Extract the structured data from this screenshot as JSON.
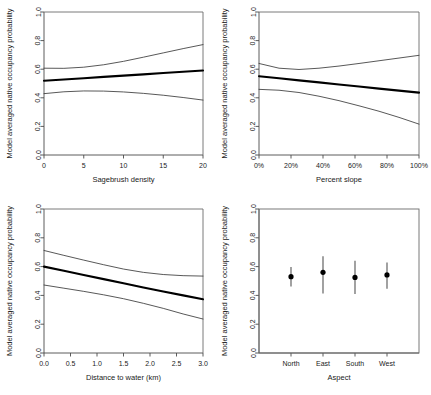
{
  "figure": {
    "background": "#ffffff",
    "axis_color": "#4a4a4a",
    "mean_color": "#000000",
    "ci_color": "#3a3a3a"
  },
  "shared": {
    "ylabel": "Model averaged native occupancy probability",
    "ylim": [
      0,
      1
    ],
    "yticks": [
      0.0,
      0.2,
      0.4,
      0.6,
      0.8,
      1.0
    ],
    "yticklabels": [
      "0.0",
      "0.2",
      "0.4",
      "0.6",
      "0.8",
      "1.0"
    ]
  },
  "chart_data": [
    {
      "type": "line",
      "panel": "top-left",
      "title": "",
      "xlabel": "Sagebrush density",
      "ylabel": "Model averaged native occupancy probability",
      "xlim": [
        0,
        20
      ],
      "ylim": [
        0,
        1
      ],
      "xticks": [
        0,
        5,
        10,
        15,
        20
      ],
      "xticklabels": [
        "0",
        "5",
        "10",
        "15",
        "20"
      ],
      "yticks": [
        0.0,
        0.2,
        0.4,
        0.6,
        0.8,
        1.0
      ],
      "yticklabels": [
        "0.0",
        "0.2",
        "0.4",
        "0.6",
        "0.8",
        "1.0"
      ],
      "grid": false,
      "legend": "none",
      "x": [
        0,
        2.5,
        5,
        7.5,
        10,
        12.5,
        15,
        17.5,
        20
      ],
      "series": [
        {
          "name": "Upper 95% CI",
          "style": "thin",
          "values": [
            0.607,
            0.606,
            0.614,
            0.631,
            0.655,
            0.684,
            0.714,
            0.744,
            0.772
          ]
        },
        {
          "name": "Model averaged estimate",
          "style": "thick",
          "values": [
            0.519,
            0.528,
            0.537,
            0.546,
            0.555,
            0.564,
            0.573,
            0.582,
            0.591
          ]
        },
        {
          "name": "Lower 95% CI",
          "style": "thin",
          "values": [
            0.429,
            0.442,
            0.448,
            0.447,
            0.441,
            0.431,
            0.418,
            0.402,
            0.384
          ]
        }
      ]
    },
    {
      "type": "line",
      "panel": "top-right",
      "title": "",
      "xlabel": "Percent slope",
      "ylabel": "Model averaged native occupancy probability",
      "xlim": [
        0,
        100
      ],
      "ylim": [
        0,
        1
      ],
      "xticks": [
        0,
        20,
        40,
        60,
        80,
        100
      ],
      "xticklabels": [
        "0%",
        "20%",
        "40%",
        "60%",
        "80%",
        "100%"
      ],
      "yticks": [
        0.0,
        0.2,
        0.4,
        0.6,
        0.8,
        1.0
      ],
      "yticklabels": [
        "0.0",
        "0.2",
        "0.4",
        "0.6",
        "0.8",
        "1.0"
      ],
      "grid": false,
      "legend": "none",
      "x": [
        0,
        12.5,
        25,
        37.5,
        50,
        62.5,
        75,
        87.5,
        100
      ],
      "series": [
        {
          "name": "Upper 95% CI",
          "style": "thin",
          "values": [
            0.64,
            0.607,
            0.598,
            0.607,
            0.622,
            0.64,
            0.659,
            0.678,
            0.697
          ]
        },
        {
          "name": "Model averaged estimate",
          "style": "thick",
          "values": [
            0.551,
            0.537,
            0.522,
            0.508,
            0.493,
            0.479,
            0.464,
            0.45,
            0.436
          ]
        },
        {
          "name": "Lower 95% CI",
          "style": "thin",
          "values": [
            0.459,
            0.453,
            0.437,
            0.411,
            0.38,
            0.344,
            0.306,
            0.263,
            0.216
          ]
        }
      ]
    },
    {
      "type": "line",
      "panel": "bottom-left",
      "title": "",
      "xlabel": "Distance to water (km)",
      "ylabel": "Model averaged native occupancy probability",
      "xlim": [
        0,
        3
      ],
      "ylim": [
        0,
        1
      ],
      "xticks": [
        0.0,
        0.5,
        1.0,
        1.5,
        2.0,
        2.5,
        3.0
      ],
      "xticklabels": [
        "0.0",
        "0.5",
        "1.0",
        "1.5",
        "2.0",
        "2.5",
        "3.0"
      ],
      "yticks": [
        0.0,
        0.2,
        0.4,
        0.6,
        0.8,
        1.0
      ],
      "yticklabels": [
        "0.0",
        "0.2",
        "0.4",
        "0.6",
        "0.8",
        "1.0"
      ],
      "grid": false,
      "legend": "none",
      "x": [
        0.0,
        0.375,
        0.75,
        1.125,
        1.5,
        1.875,
        2.25,
        2.625,
        3.0
      ],
      "series": [
        {
          "name": "Upper 95% CI",
          "style": "thin",
          "values": [
            0.712,
            0.678,
            0.645,
            0.613,
            0.583,
            0.56,
            0.545,
            0.537,
            0.534
          ]
        },
        {
          "name": "Model averaged estimate",
          "style": "thick",
          "values": [
            0.6,
            0.571,
            0.542,
            0.513,
            0.484,
            0.455,
            0.427,
            0.4,
            0.373
          ]
        },
        {
          "name": "Lower 95% CI",
          "style": "thin",
          "values": [
            0.472,
            0.45,
            0.428,
            0.404,
            0.377,
            0.345,
            0.31,
            0.271,
            0.236
          ]
        }
      ]
    },
    {
      "type": "scatter",
      "panel": "bottom-right",
      "title": "",
      "xlabel": "Aspect",
      "ylabel": "Model averaged native occupancy probability",
      "ylim": [
        0,
        1
      ],
      "yticks": [
        0.0,
        0.2,
        0.4,
        0.6,
        0.8,
        1.0
      ],
      "yticklabels": [
        "0.0",
        "0.2",
        "0.4",
        "0.6",
        "0.8",
        "1.0"
      ],
      "grid": false,
      "legend": "none",
      "categories": [
        "North",
        "East",
        "South",
        "West"
      ],
      "values": [
        0.53,
        0.56,
        0.525,
        0.542
      ],
      "ci_lower": [
        0.462,
        0.413,
        0.41,
        0.446
      ],
      "ci_upper": [
        0.597,
        0.672,
        0.64,
        0.628
      ],
      "error_bars": true
    }
  ]
}
